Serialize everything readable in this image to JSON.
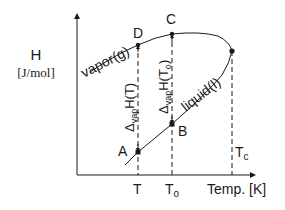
{
  "diagram": {
    "y_axis": {
      "label": "H",
      "unit": "[J/mol]"
    },
    "x_axis": {
      "label": "Temp. [K]"
    },
    "x_ticks": [
      {
        "label": "T",
        "sub": ""
      },
      {
        "label": "T",
        "sub": "o"
      }
    ],
    "critical_label": {
      "main": "T",
      "sub": "c"
    },
    "curves": {
      "vapor": "vapor(g)",
      "liquid": "liquid(l)"
    },
    "points": {
      "A": "A",
      "B": "B",
      "C": "C",
      "D": "D"
    },
    "annotations": {
      "dH_T": {
        "delta": "Δ",
        "sub": "vap",
        "text": "H(T)"
      },
      "dH_To": {
        "delta": "Δ",
        "sub": "vap",
        "text": "H(T",
        "sub2": "o",
        "close": ")"
      }
    },
    "colors": {
      "line": "#1a1a1a",
      "background": "#ffffff"
    }
  }
}
